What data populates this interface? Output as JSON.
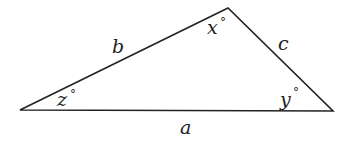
{
  "diagram": {
    "type": "triangle",
    "stroke_color": "#222222",
    "background": "#ffffff",
    "vertices": {
      "top": {
        "x": 228,
        "y": 8
      },
      "left": {
        "x": 20,
        "y": 110
      },
      "right": {
        "x": 333,
        "y": 111
      }
    },
    "sides": {
      "a": {
        "label": "a",
        "between": [
          "left",
          "right"
        ]
      },
      "b": {
        "label": "b",
        "between": [
          "left",
          "top"
        ]
      },
      "c": {
        "label": "c",
        "between": [
          "top",
          "right"
        ]
      }
    },
    "angles": {
      "x": {
        "label": "x",
        "degree": "°",
        "vertex": "top"
      },
      "y": {
        "label": "y",
        "degree": "°",
        "vertex": "right"
      },
      "z": {
        "label": "z",
        "degree": "°",
        "vertex": "left"
      }
    }
  }
}
